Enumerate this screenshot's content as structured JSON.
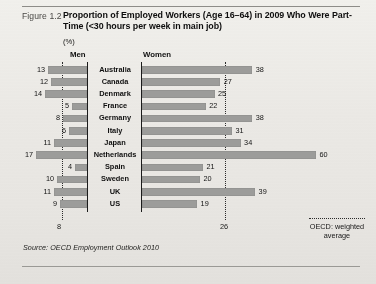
{
  "figure": {
    "number": "Figure 1.2",
    "title": "Proportion of Employed Workers (Age 16–64) in 2009 Who Were Part-Time (<30 hours per week in main job)",
    "unit_label": "(%)",
    "source": "Source: OECD Employment Outlook 2010"
  },
  "legend": {
    "marker": "dotted-line",
    "text": "OECD: weighted average"
  },
  "headers": {
    "men": "Men",
    "women": "Women"
  },
  "reference": {
    "men_label": "8",
    "women_label": "26"
  },
  "colors": {
    "bar": "#9d9d9b",
    "axis": "#1b1b1b",
    "paper": "#eeedea",
    "text": "#111111"
  },
  "chart_data": {
    "type": "bar",
    "title": "Proportion of Employed Workers (Age 16–64) in 2009 Who Were Part-Time (<30 hours per week in main job)",
    "xlabel": "(%)",
    "ylabel": "",
    "orientation": "horizontal",
    "layout": "diverging-paired (Men left, Women right)",
    "grid": false,
    "legend_position": "bottom-right",
    "xlim_men": [
      0,
      20
    ],
    "xlim_women": [
      0,
      62
    ],
    "categories": [
      "Australia",
      "Canada",
      "Denmark",
      "France",
      "Germany",
      "Italy",
      "Japan",
      "Netherlands",
      "Spain",
      "Sweden",
      "UK",
      "US"
    ],
    "series": [
      {
        "name": "Men",
        "values": [
          13,
          12,
          14,
          5,
          8,
          6,
          11,
          17,
          4,
          10,
          11,
          9
        ]
      },
      {
        "name": "Women",
        "values": [
          38,
          27,
          25,
          22,
          38,
          31,
          34,
          60,
          21,
          20,
          39,
          19
        ]
      }
    ],
    "annotations": [
      {
        "name": "OECD weighted average (Men)",
        "value": 8,
        "type": "vertical-dotted-line"
      },
      {
        "name": "OECD weighted average (Women)",
        "value": 26,
        "type": "vertical-dotted-line"
      }
    ]
  },
  "rows": [
    {
      "country": "Australia",
      "men": "13",
      "women": "38"
    },
    {
      "country": "Canada",
      "men": "12",
      "women": "27"
    },
    {
      "country": "Denmark",
      "men": "14",
      "women": "25"
    },
    {
      "country": "France",
      "men": "5",
      "women": "22"
    },
    {
      "country": "Germany",
      "men": "8",
      "women": "38"
    },
    {
      "country": "Italy",
      "men": "6",
      "women": "31"
    },
    {
      "country": "Japan",
      "men": "11",
      "women": "34"
    },
    {
      "country": "Netherlands",
      "men": "17",
      "women": "60"
    },
    {
      "country": "Spain",
      "men": "4",
      "women": "21"
    },
    {
      "country": "Sweden",
      "men": "10",
      "women": "20"
    },
    {
      "country": "UK",
      "men": "11",
      "women": "39"
    },
    {
      "country": "US",
      "men": "9",
      "women": "19"
    }
  ]
}
